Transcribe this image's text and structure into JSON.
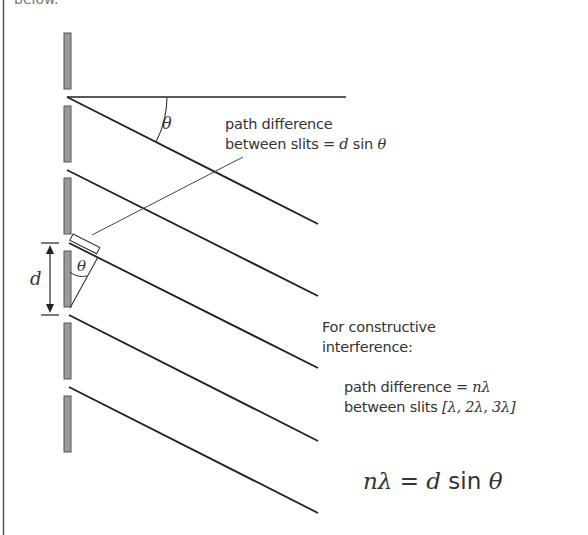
{
  "caption_fragment": "below.",
  "colors": {
    "line": "#222222",
    "thin_line": "#444444",
    "slit_fill": "#9a9a9a",
    "slit_stroke": "#555555",
    "text": "#333333",
    "border": "#555555"
  },
  "diagram": {
    "angle_symbol": "θ",
    "slit_spacing_symbol": "d",
    "labels": {
      "path_diff_line1": "path difference",
      "path_diff_line2": "between slits = ",
      "path_diff_expr_d": "d",
      "path_diff_expr_sin": " sin ",
      "path_diff_expr_theta": "θ",
      "constructive_line1": "For constructive",
      "constructive_line2": "interference:",
      "cond_line1": "path difference = ",
      "cond_line1_expr": "nλ",
      "cond_line2": "between slits ",
      "cond_line2_expr": "[λ, 2λ, 3λ]",
      "equation_n": "n",
      "equation_lambda": "λ",
      "equation_eq": " = ",
      "equation_d": "d",
      "equation_sin": " sin ",
      "equation_theta": "θ"
    },
    "slits_count": 6,
    "rays_count": 6
  }
}
